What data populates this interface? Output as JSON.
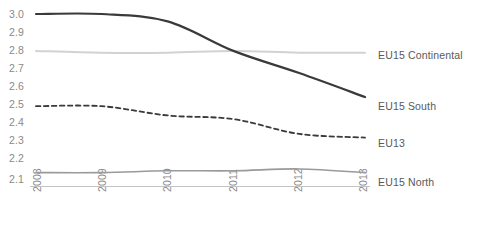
{
  "chart_data": {
    "type": "line",
    "title": "",
    "subtitle": "",
    "xlabel": "",
    "ylabel": "",
    "categories": [
      "2008",
      "2009",
      "2010",
      "2011",
      "2012",
      "2013"
    ],
    "x": [
      2008,
      2009,
      2010,
      2011,
      2012,
      2013
    ],
    "ylim": [
      2.1,
      3.0
    ],
    "xlim": [
      2008,
      2013
    ],
    "yticks": [
      "3.0",
      "2.9",
      "2.8",
      "2.7",
      "2.6",
      "2.5",
      "2.4",
      "2.3",
      "2.2",
      "2.1"
    ],
    "ytick_values": [
      3.0,
      2.9,
      2.8,
      2.7,
      2.6,
      2.5,
      2.4,
      2.3,
      2.2,
      2.1
    ],
    "grid": false,
    "legend_position": "right-inline",
    "series": [
      {
        "name": "EU15 South",
        "values": [
          3.0,
          3.0,
          2.96,
          2.8,
          2.68,
          2.55
        ],
        "color": "#3a3a3a",
        "style": "solid",
        "width": 2.2,
        "label_y": 100
      },
      {
        "name": "EU15 Continental",
        "values": [
          2.8,
          2.79,
          2.79,
          2.8,
          2.79,
          2.79
        ],
        "color": "#d2d2d2",
        "style": "solid",
        "width": 2.0,
        "label_y": 49
      },
      {
        "name": "EU13",
        "values": [
          2.5,
          2.5,
          2.45,
          2.43,
          2.35,
          2.33
        ],
        "color": "#3a3a3a",
        "style": "dashed",
        "width": 1.8,
        "label_y": 137
      },
      {
        "name": "EU15 North",
        "values": [
          2.14,
          2.14,
          2.15,
          2.15,
          2.16,
          2.14
        ],
        "color": "#9a9a9a",
        "style": "solid",
        "width": 1.6,
        "label_y": 176
      }
    ]
  },
  "axis": {
    "y_labels": [
      "3.0",
      "2.9",
      "2.8",
      "2.7",
      "2.6",
      "2.5",
      "2.4",
      "2.3",
      "2.2",
      "2.1"
    ],
    "x_labels": [
      "2008",
      "2009",
      "2010",
      "2011",
      "2012",
      "2013"
    ]
  },
  "series_labels": {
    "continental": "EU15 Continental",
    "south": "EU15 South",
    "eu13": "EU13",
    "north": "EU15 North"
  },
  "colors": {
    "south": "#3a3a3a",
    "continental": "#d2d2d2",
    "eu13": "#3a3a3a",
    "north": "#9a9a9a",
    "axis_line": "#b8b8b8",
    "tick_text": "#8a8a8a",
    "label_text": "#58595b"
  }
}
